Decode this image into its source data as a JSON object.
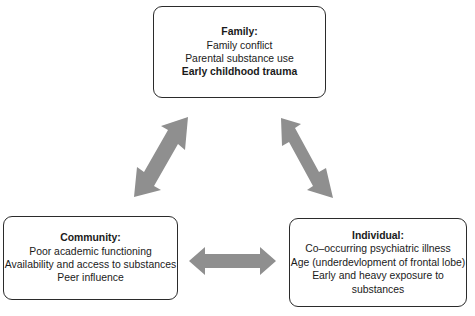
{
  "diagram": {
    "nodes": {
      "family": {
        "title": "Family:",
        "items": [
          {
            "text": "Family conflict",
            "bold": false
          },
          {
            "text": "Parental substance use",
            "bold": false
          },
          {
            "text": "Early childhood trauma",
            "bold": true
          }
        ]
      },
      "community": {
        "title": "Community:",
        "items": [
          {
            "text": "Poor academic functioning",
            "bold": false
          },
          {
            "text": "Availability and access to substances",
            "bold": false
          },
          {
            "text": "Peer influence",
            "bold": false
          }
        ]
      },
      "individual": {
        "title": "Individual:",
        "items": [
          {
            "text": "Co–occurring psychiatric illness",
            "bold": false
          },
          {
            "text": "Age (underdevlopment of frontal lobe)",
            "bold": false
          },
          {
            "text": "Early and heavy exposure to",
            "bold": false
          },
          {
            "text": "substances",
            "bold": false
          }
        ]
      }
    },
    "edges": [
      {
        "from": "family",
        "to": "community",
        "type": "bidirectional"
      },
      {
        "from": "family",
        "to": "individual",
        "type": "bidirectional"
      },
      {
        "from": "community",
        "to": "individual",
        "type": "bidirectional"
      }
    ],
    "colors": {
      "arrow": "#8f8f8f",
      "box_border": "#2b2b2b",
      "text": "#1a1a1a"
    }
  }
}
